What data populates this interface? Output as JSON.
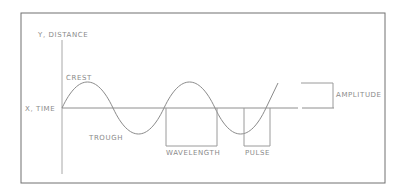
{
  "diagram": {
    "type": "wave-anatomy",
    "labels": {
      "y_axis": "Y, DISTANCE",
      "x_axis": "X, TIME",
      "crest": "CREST",
      "trough": "TROUGH",
      "wavelength": "WAVELENGTH",
      "pulse": "PULSE",
      "amplitude": "AMPLITUDE"
    },
    "colors": {
      "frame": "#6e6e6e",
      "lines": "#9a9a9a",
      "text": "#8a8a8a"
    }
  }
}
